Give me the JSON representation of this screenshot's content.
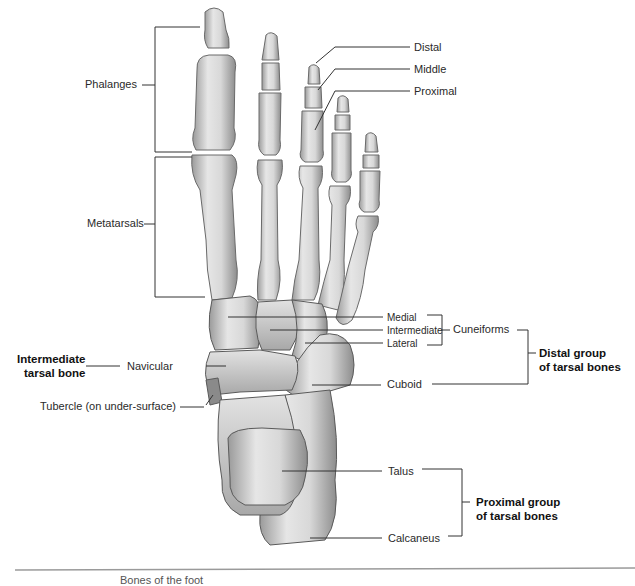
{
  "figure": {
    "colors": {
      "bone_light": "#ececec",
      "bone_mid": "#c8c8c8",
      "bone_dark": "#8a8a8a",
      "line": "#333333",
      "rule": "#9a9a9a"
    }
  },
  "labels": {
    "phalanges": "Phalanges",
    "metatarsals": "Metatarsals",
    "distal": "Distal",
    "middle": "Middle",
    "proximal": "Proximal",
    "medial": "Medial",
    "intermediate": "Intermediate",
    "lateral": "Lateral",
    "cuneiforms": "Cuneiforms",
    "distal_group_line1": "Distal group",
    "distal_group_line2": "of tarsal bones",
    "cuboid": "Cuboid",
    "navicular": "Navicular",
    "intermediate_tarsal_line1": "Intermediate",
    "intermediate_tarsal_line2": "tarsal bone",
    "tubercle": "Tubercle (on under-surface)",
    "talus": "Talus",
    "calcaneus": "Calcaneus",
    "proximal_group_line1": "Proximal group",
    "proximal_group_line2": "of tarsal bones"
  },
  "caption": "Bones of the foot"
}
